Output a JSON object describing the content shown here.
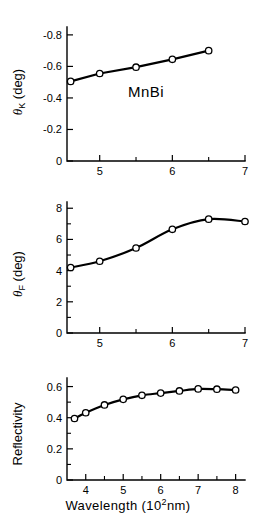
{
  "figure": {
    "sample_label": "MnBi",
    "xaxis_caption_text": "Wavelength  (10",
    "xaxis_caption_sup": "2",
    "xaxis_caption_tail": "nm)",
    "ink_color": "#000000",
    "background_color": "#ffffff",
    "marker_fill": "#ffffff"
  },
  "chart_data": [
    {
      "type": "line",
      "title": "",
      "panel_name": "kerr-rotation",
      "xlabel": "",
      "ylabel": "θK (deg)",
      "ylabel_symbol": "θ",
      "ylabel_subscript": "K",
      "ylabel_unit": "(deg)",
      "annotation": "MnBi",
      "xlim": [
        4.55,
        7.0
      ],
      "ylim": [
        0.0,
        -0.85
      ],
      "xticks": [
        5,
        6,
        7
      ],
      "xticklabels": [
        "5",
        "6",
        "7"
      ],
      "xticks_minor": [
        5.5,
        6.5
      ],
      "yticks": [
        0,
        -0.2,
        -0.4,
        -0.6,
        -0.8
      ],
      "yticklabels": [
        "0",
        "-0.2",
        "-0.4",
        "-0.6",
        "-0.8"
      ],
      "grid": false,
      "legend": "none",
      "x": [
        4.6,
        5.0,
        5.5,
        6.0,
        6.5
      ],
      "values": [
        -0.505,
        -0.555,
        -0.595,
        -0.645,
        -0.7
      ]
    },
    {
      "type": "line",
      "title": "",
      "panel_name": "faraday-rotation",
      "xlabel": "",
      "ylabel": "θF (deg)",
      "ylabel_symbol": "θ",
      "ylabel_subscript": "F",
      "ylabel_unit": "(deg)",
      "annotation": "",
      "xlim": [
        4.55,
        7.0
      ],
      "ylim": [
        0,
        8.4
      ],
      "xticks": [
        5,
        6,
        7
      ],
      "xticklabels": [
        "5",
        "6",
        "7"
      ],
      "xticks_minor": [
        5.5,
        6.5
      ],
      "yticks": [
        0,
        2,
        4,
        6,
        8
      ],
      "yticklabels": [
        "0",
        "2",
        "4",
        "6",
        "8"
      ],
      "yticks_minor": [
        1,
        3,
        5,
        7
      ],
      "grid": false,
      "legend": "none",
      "x": [
        4.6,
        5.0,
        5.5,
        6.0,
        6.5,
        7.0
      ],
      "values": [
        4.2,
        4.6,
        5.45,
        6.65,
        7.3,
        7.15
      ]
    },
    {
      "type": "line",
      "title": "",
      "panel_name": "reflectivity",
      "xlabel": "Wavelength (10^2 nm)",
      "ylabel": "Reflectivity",
      "annotation": "",
      "xlim": [
        3.5,
        8.25
      ],
      "ylim": [
        0,
        0.655
      ],
      "xticks": [
        4,
        5,
        6,
        7,
        8
      ],
      "xticklabels": [
        "4",
        "5",
        "6",
        "7",
        "8"
      ],
      "xticks_minor": [
        4.5,
        5.5,
        6.5,
        7.5
      ],
      "yticks": [
        0,
        0.2,
        0.4,
        0.6
      ],
      "yticklabels": [
        "0",
        "0.2",
        "0.4",
        "0.6"
      ],
      "yticks_minor": [
        0.1,
        0.3,
        0.5
      ],
      "grid": false,
      "legend": "none",
      "x": [
        3.7,
        4.0,
        4.5,
        5.0,
        5.5,
        6.0,
        6.5,
        7.0,
        7.5,
        8.0
      ],
      "values": [
        0.395,
        0.432,
        0.482,
        0.518,
        0.544,
        0.558,
        0.572,
        0.585,
        0.583,
        0.578
      ]
    }
  ]
}
